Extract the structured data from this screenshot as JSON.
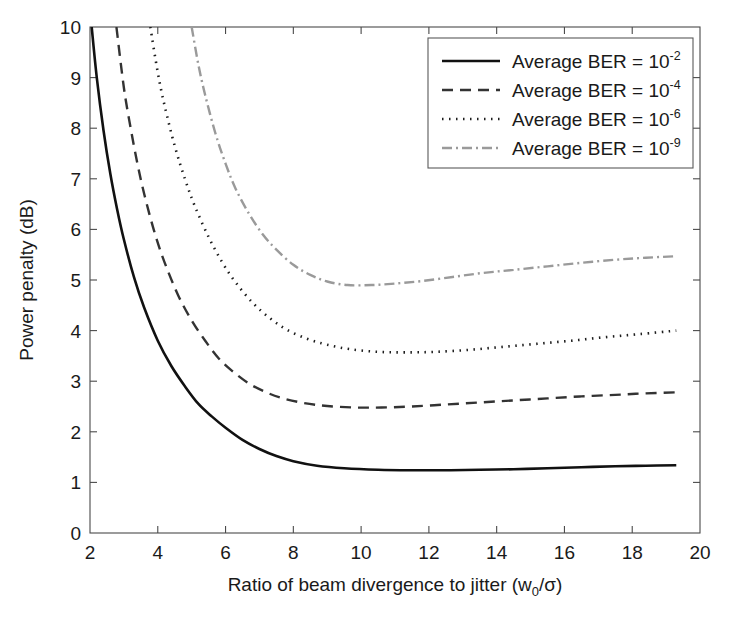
{
  "chart_data": {
    "type": "line",
    "title": "",
    "xlabel": "Ratio of beam divergence to jitter (w0/σ)",
    "xlabel_main": "Ratio of beam divergence to jitter (w",
    "xlabel_sub": "0",
    "xlabel_tail": "/σ)",
    "ylabel": "Power penalty (dB)",
    "xlim": [
      2,
      20
    ],
    "ylim": [
      0,
      10
    ],
    "xticks": [
      2,
      4,
      6,
      8,
      10,
      12,
      14,
      16,
      18,
      20
    ],
    "yticks": [
      0,
      1,
      2,
      3,
      4,
      5,
      6,
      7,
      8,
      9,
      10
    ],
    "grid": false,
    "legend_position": "upper right",
    "series": [
      {
        "name": "Average BER = 10^-2",
        "label_main": "Average BER = 10",
        "label_exp": "-2",
        "style": "solid",
        "color": "#111111",
        "width": 2.6,
        "dasharray": "",
        "x": [
          2.05,
          2.2,
          2.4,
          2.6,
          2.8,
          3.0,
          3.3,
          3.6,
          4.0,
          4.4,
          4.8,
          5.2,
          5.6,
          6.0,
          6.5,
          7.0,
          7.5,
          8.0,
          8.7,
          9.5,
          10.5,
          11.5,
          12.5,
          13.5,
          14.5,
          15.5,
          16.5,
          17.5,
          18.4,
          19.3
        ],
        "y": [
          10.0,
          9.0,
          7.95,
          7.1,
          6.4,
          5.8,
          5.05,
          4.45,
          3.8,
          3.3,
          2.9,
          2.55,
          2.3,
          2.08,
          1.84,
          1.66,
          1.52,
          1.42,
          1.33,
          1.28,
          1.25,
          1.24,
          1.24,
          1.25,
          1.26,
          1.28,
          1.3,
          1.32,
          1.33,
          1.34
        ]
      },
      {
        "name": "Average BER = 10^-4",
        "label_main": "Average BER = 10",
        "label_exp": "-4",
        "style": "dashed",
        "color": "#333333",
        "width": 2.4,
        "dasharray": "11,7",
        "x": [
          2.78,
          3.0,
          3.2,
          3.4,
          3.6,
          3.9,
          4.2,
          4.6,
          5.0,
          5.4,
          5.8,
          6.2,
          6.7,
          7.2,
          7.7,
          8.3,
          9.0,
          9.8,
          10.6,
          11.5,
          12.5,
          13.5,
          14.5,
          15.5,
          16.5,
          17.5,
          18.4,
          19.3
        ],
        "y": [
          10.0,
          8.8,
          8.0,
          7.3,
          6.7,
          5.95,
          5.35,
          4.7,
          4.2,
          3.8,
          3.45,
          3.2,
          2.95,
          2.78,
          2.66,
          2.57,
          2.51,
          2.48,
          2.48,
          2.5,
          2.54,
          2.58,
          2.62,
          2.66,
          2.7,
          2.73,
          2.76,
          2.78
        ]
      },
      {
        "name": "Average BER = 10^-6",
        "label_main": "Average BER = 10",
        "label_exp": "-6",
        "style": "dotted",
        "color": "#1d1d1d",
        "width": 2.6,
        "dasharray": "1.5,5.5",
        "x": [
          3.78,
          4.0,
          4.2,
          4.5,
          4.8,
          5.1,
          5.5,
          5.9,
          6.3,
          6.8,
          7.3,
          7.8,
          8.4,
          9.0,
          9.7,
          10.5,
          11.3,
          12.2,
          13.2,
          14.2,
          15.2,
          16.2,
          17.2,
          18.2,
          19.3
        ],
        "y": [
          10.0,
          9.1,
          8.45,
          7.65,
          7.0,
          6.45,
          5.85,
          5.35,
          4.95,
          4.55,
          4.25,
          4.02,
          3.84,
          3.72,
          3.63,
          3.58,
          3.57,
          3.58,
          3.62,
          3.68,
          3.74,
          3.8,
          3.87,
          3.93,
          4.0
        ]
      },
      {
        "name": "Average BER = 10^-9",
        "label_main": "Average BER = 10",
        "label_exp": "-9",
        "style": "dashdot",
        "color": "#9a9a9a",
        "width": 2.4,
        "dasharray": "10,4,2,4",
        "x": [
          5.0,
          5.2,
          5.4,
          5.7,
          6.0,
          6.3,
          6.7,
          7.1,
          7.5,
          8.0,
          8.5,
          9.0,
          9.6,
          10.3,
          11.0,
          11.8,
          12.7,
          13.6,
          14.5,
          15.5,
          16.5,
          17.5,
          18.4,
          19.3
        ],
        "y": [
          10.0,
          9.25,
          8.65,
          7.9,
          7.3,
          6.8,
          6.3,
          5.9,
          5.6,
          5.3,
          5.1,
          4.97,
          4.9,
          4.9,
          4.93,
          4.98,
          5.06,
          5.14,
          5.2,
          5.27,
          5.34,
          5.4,
          5.44,
          5.47
        ]
      }
    ]
  },
  "legend": {
    "title": "",
    "entries": [
      {
        "label_main": "Average BER = 10",
        "label_exp": "-2"
      },
      {
        "label_main": "Average BER = 10",
        "label_exp": "-4"
      },
      {
        "label_main": "Average BER = 10",
        "label_exp": "-6"
      },
      {
        "label_main": "Average BER = 10",
        "label_exp": "-9"
      }
    ]
  },
  "colors": {
    "axis": "#4a4a4a",
    "text": "#1a1a1a",
    "background": "#ffffff"
  }
}
